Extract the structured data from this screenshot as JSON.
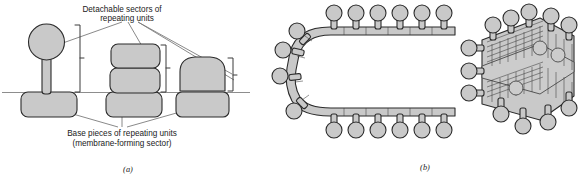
{
  "figure": {
    "title_top_label": {
      "line1": "Detachable sectors of",
      "line2": "repeating units"
    },
    "bottom_label": {
      "line1": "Base pieces of repeating units",
      "line2": "(membrane-forming sector)"
    },
    "panels": [
      {
        "id": "a",
        "label": "(a)"
      },
      {
        "id": "b",
        "label": "(b)"
      }
    ],
    "colors": {
      "unit_fill": "#c9c9c9",
      "unit_stroke": "#2b2b2b",
      "membrane_line": "#8d8d8d",
      "leader_line": "#7c7c7c",
      "bracket": "#3a3a3a",
      "background": "#ffffff",
      "text": "#1a1a1a"
    },
    "panel_a": {
      "description": "Three repeating-unit morphologies on a membrane line",
      "structures": [
        {
          "name": "stalked-sphere-unit",
          "head_shape": "sphere",
          "has_stalk": true,
          "base": "rounded-rectangle"
        },
        {
          "name": "stacked-blocks-unit",
          "head_shape": "two-stacked-rounded-blocks",
          "has_stalk": false,
          "base": "rounded-rectangle"
        },
        {
          "name": "dome-unit",
          "head_shape": "dome",
          "has_stalk": false,
          "base": "rounded-rectangle"
        }
      ],
      "bracket_count": 3,
      "leader_count": 6
    },
    "panel_b": {
      "description": "Cristae membrane cross-section and three-dimensional view with projecting repeating units",
      "views": [
        {
          "name": "cross-section-u-shape",
          "particle_rows": 2
        },
        {
          "name": "three-dimensional-sheet",
          "particle_rows": 2
        }
      ]
    }
  }
}
